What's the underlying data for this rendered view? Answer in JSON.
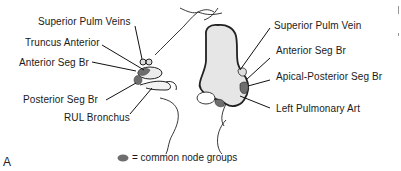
{
  "figure": {
    "panel_label": "A",
    "colors": {
      "outline": "#222222",
      "fill": "#e6e6e6",
      "node": "#6e6e6e",
      "text": "#1a1a1a"
    },
    "right_lung_labels": [
      {
        "id": "superior-pulm-veins",
        "text": "Superior Pulm Veins"
      },
      {
        "id": "truncus-anterior",
        "text": "Truncus Anterior"
      },
      {
        "id": "anterior-seg-br-right",
        "text": "Anterior Seg Br"
      },
      {
        "id": "posterior-seg-br",
        "text": "Posterior Seg Br"
      },
      {
        "id": "rul-bronchus",
        "text": "RUL Bronchus"
      }
    ],
    "left_lung_labels": [
      {
        "id": "superior-pulm-vein",
        "text": "Superior Pulm Vein"
      },
      {
        "id": "anterior-seg-br-left",
        "text": "Anterior Seg Br"
      },
      {
        "id": "apical-posterior-seg-br",
        "text": "Apical-Posterior Seg Br"
      },
      {
        "id": "left-pulmonary-art",
        "text": "Left Pulmonary Art"
      }
    ],
    "legend": {
      "symbol": "node-ellipse",
      "text": "= common node groups"
    }
  }
}
